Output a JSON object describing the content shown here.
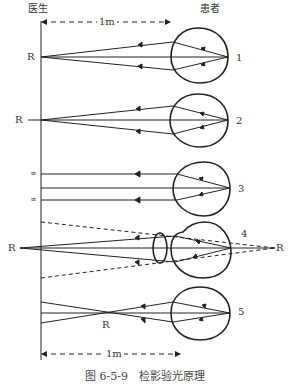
{
  "header": {
    "doctor_label": "医生",
    "patient_label": "患者"
  },
  "distance": {
    "top_label": "1m",
    "bottom_label": "1m"
  },
  "rows": [
    {
      "number": "1",
      "left_label": "R"
    },
    {
      "number": "2",
      "left_label": "R"
    },
    {
      "number": "3",
      "left_label_top": "∞",
      "left_label_bottom": "∞"
    },
    {
      "number": "4",
      "left_label": "R",
      "right_label": "R"
    },
    {
      "number": "5",
      "cross_label": "R"
    }
  ],
  "caption": "图 6-5-9　检影验光原理"
}
